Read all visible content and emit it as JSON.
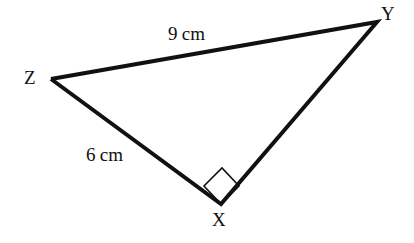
{
  "figure": {
    "type": "geometry-diagram",
    "shape": "triangle",
    "background_color": "#ffffff",
    "stroke_color": "#111111",
    "stroke_width_px": 4,
    "mark_stroke_width_px": 1.6,
    "canvas": {
      "width": 414,
      "height": 243
    }
  },
  "vertices": [
    {
      "id": "X",
      "label": "X",
      "x": 221,
      "y": 204,
      "label_x": 212,
      "label_y": 210
    },
    {
      "id": "Y",
      "label": "Y",
      "x": 377,
      "y": 22,
      "label_x": 381,
      "label_y": 4
    },
    {
      "id": "Z",
      "label": "Z",
      "x": 51,
      "y": 79,
      "label_x": 24,
      "label_y": 68
    }
  ],
  "sides": [
    {
      "id": "ZY",
      "from": "Z",
      "to": "Y",
      "label": "9 cm",
      "length_value": 9,
      "unit": "cm",
      "label_x": 168,
      "label_y": 24
    },
    {
      "id": "ZX",
      "from": "Z",
      "to": "X",
      "label": "6 cm",
      "length_value": 6,
      "unit": "cm",
      "label_x": 86,
      "label_y": 145
    },
    {
      "id": "XY",
      "from": "X",
      "to": "Y",
      "label": "",
      "length_value": null,
      "unit": "",
      "label_x": null,
      "label_y": null
    }
  ],
  "angle_marks": [
    {
      "id": "right-angle-at-X",
      "at_vertex": "X",
      "type": "right-angle-square",
      "degrees": 90,
      "points": "221,204 204,186 222,168 239,186"
    }
  ],
  "polyline": {
    "points": "51,79 377,22 221,204 51,79"
  }
}
